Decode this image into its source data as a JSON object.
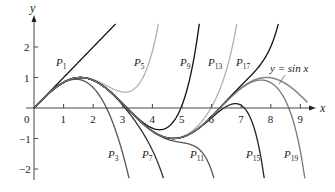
{
  "chart_data": {
    "type": "line",
    "title": "",
    "xlabel": "x",
    "ylabel": "y",
    "xlim": [
      0,
      9.4
    ],
    "ylim": [
      -2.3,
      2.8
    ],
    "x_ticks": [
      0,
      1,
      2,
      3,
      4,
      5,
      6,
      7,
      8,
      9
    ],
    "y_ticks": [
      -2,
      -1,
      1,
      2
    ],
    "grid": false,
    "legend": "inline labels",
    "annotation": "y = sin x",
    "series": [
      {
        "name": "y = sin x",
        "kind": "sin",
        "color": "#8a8a8a",
        "label_pos": [
          270,
          72
        ]
      },
      {
        "name": "P1",
        "degree": 1,
        "color": "#111111",
        "label_pos": [
          56,
          66
        ]
      },
      {
        "name": "P3",
        "degree": 3,
        "color": "#555555",
        "label_pos": [
          108,
          158
        ]
      },
      {
        "name": "P5",
        "degree": 5,
        "color": "#b0b0b0",
        "label_pos": [
          134,
          66
        ]
      },
      {
        "name": "P7",
        "degree": 7,
        "color": "#333333",
        "label_pos": [
          142,
          158
        ]
      },
      {
        "name": "P9",
        "degree": 9,
        "color": "#111111",
        "label_pos": [
          180,
          66
        ]
      },
      {
        "name": "P11",
        "degree": 11,
        "color": "#555555",
        "label_pos": [
          190,
          158
        ]
      },
      {
        "name": "P13",
        "degree": 13,
        "color": "#b0b0b0",
        "label_pos": [
          208,
          66
        ]
      },
      {
        "name": "P15",
        "degree": 15,
        "color": "#222222",
        "label_pos": [
          246,
          158
        ]
      },
      {
        "name": "P17",
        "degree": 17,
        "color": "#111111",
        "label_pos": [
          236,
          66
        ]
      },
      {
        "name": "P19",
        "degree": 19,
        "color": "#777777",
        "label_pos": [
          284,
          158
        ]
      }
    ]
  },
  "axes": {
    "x_label": "x",
    "y_label": "y",
    "origin_label": "0",
    "x_tick_labels": [
      "1",
      "2",
      "3",
      "4",
      "5",
      "6",
      "7",
      "8",
      "9"
    ],
    "y_tick_labels": [
      "2",
      "1",
      "−1",
      "−2"
    ]
  }
}
